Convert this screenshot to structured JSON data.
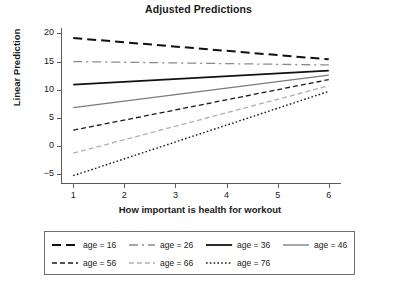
{
  "chart_data": {
    "type": "line",
    "title": "Adjusted Predictions",
    "xlabel": "How important is health for workout",
    "ylabel": "Linear Prediction",
    "x": [
      1,
      6
    ],
    "xlim": [
      0.78,
      6.22
    ],
    "ylim": [
      -6.6,
      20.8
    ],
    "xticks": [
      1,
      2,
      3,
      4,
      5,
      6
    ],
    "xtick_labels": [
      "1",
      "2",
      "3",
      "4",
      "5",
      "6"
    ],
    "yticks": [
      -5,
      0,
      5,
      10,
      15,
      20
    ],
    "ytick_labels": [
      "−5",
      "0",
      "5",
      "10",
      "15",
      "20"
    ],
    "grid": false,
    "legend_position": "bottom",
    "legend_border": true,
    "series": [
      {
        "name": "age = 16",
        "label": "age = 16",
        "values": [
          19.2,
          15.4
        ],
        "style": "dashed",
        "color": "#111111",
        "width": 2.0,
        "dasharray": "9,5"
      },
      {
        "name": "age = 26",
        "label": "age = 26",
        "values": [
          15.0,
          14.4
        ],
        "style": "dash-dot",
        "color": "#8a8a8a",
        "width": 1.3,
        "dasharray": "9,4,2,4"
      },
      {
        "name": "age = 36",
        "label": "age = 36",
        "values": [
          10.9,
          13.4
        ],
        "style": "solid",
        "color": "#111111",
        "width": 1.8,
        "dasharray": "none"
      },
      {
        "name": "age = 46",
        "label": "age = 46",
        "values": [
          6.8,
          12.6
        ],
        "style": "solid",
        "color": "#7a7a7a",
        "width": 1.3,
        "dasharray": "none"
      },
      {
        "name": "age = 56",
        "label": "age = 56",
        "values": [
          2.8,
          11.8
        ],
        "style": "dashed-short",
        "color": "#1a1a1a",
        "width": 1.3,
        "dasharray": "5,3"
      },
      {
        "name": "age = 66",
        "label": "age = 66",
        "values": [
          -1.3,
          10.7
        ],
        "style": "dashed-short",
        "color": "#b0b0b0",
        "width": 1.3,
        "dasharray": "5,3"
      },
      {
        "name": "age = 76",
        "label": "age = 76",
        "values": [
          -5.3,
          9.7
        ],
        "style": "dotted",
        "color": "#1a1a1a",
        "width": 1.4,
        "dasharray": "1.6,2.2"
      }
    ]
  }
}
